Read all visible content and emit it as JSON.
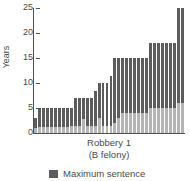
{
  "chart_data": {
    "type": "bar",
    "title": "",
    "xlabel": "Robbery 1",
    "xlabel_sub": "(B felony)",
    "ylabel": "Years",
    "ylim": [
      0,
      25
    ],
    "yticks": [
      0,
      5,
      10,
      15,
      20,
      25
    ],
    "ytick_labels": [
      "0",
      "5",
      "10",
      "15",
      "20",
      "25"
    ],
    "grid": false,
    "stacked": true,
    "legend_position": "bottom",
    "legend": [
      {
        "label": "Maximum sentence",
        "color": "#5c5c5c"
      }
    ],
    "series": [
      {
        "name": "Minimum sentence",
        "color": "#b4b4b4",
        "values": [
          1,
          1.2,
          1.2,
          1.2,
          1.2,
          1.2,
          1.2,
          1.2,
          1.2,
          1.5,
          1.5,
          1.5,
          2.8,
          1.5,
          1.5,
          1.5,
          3,
          1.5,
          1.5,
          1.5,
          2,
          3,
          4,
          4,
          4,
          4,
          4,
          4,
          4,
          5,
          5,
          5,
          5,
          5,
          5,
          5,
          6,
          6
        ]
      },
      {
        "name": "Maximum sentence",
        "color": "#5c5c5c",
        "values": [
          3,
          5,
          5,
          5,
          5,
          5,
          5,
          5,
          5,
          5,
          7,
          7,
          7,
          7,
          7,
          8.5,
          10,
          10,
          10,
          11.5,
          15,
          15,
          15,
          15,
          15,
          15,
          15,
          15,
          15,
          18,
          18,
          18,
          18,
          18,
          18,
          18,
          25,
          25
        ]
      }
    ],
    "categories": [
      "1",
      "2",
      "3",
      "4",
      "5",
      "6",
      "7",
      "8",
      "9",
      "10",
      "11",
      "12",
      "13",
      "14",
      "15",
      "16",
      "17",
      "18",
      "19",
      "20",
      "21",
      "22",
      "23",
      "24",
      "25",
      "26",
      "27",
      "28",
      "29",
      "30",
      "31",
      "32",
      "33",
      "34",
      "35",
      "36",
      "37",
      "38"
    ]
  }
}
